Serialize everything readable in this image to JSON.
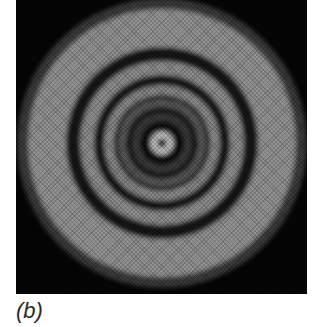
{
  "figure": {
    "panel_label": "(b)",
    "center": {
      "x": 146,
      "y": 143
    },
    "rings": [
      {
        "r_inner": 0,
        "r_outer": 4,
        "shade": "#050505"
      },
      {
        "r_inner": 4,
        "r_outer": 12,
        "shade": "#bdbdbd"
      },
      {
        "r_inner": 12,
        "r_outer": 22,
        "shade": "#0a0a0a"
      },
      {
        "r_inner": 22,
        "r_outer": 30,
        "shade": "#3a3a3a"
      },
      {
        "r_inner": 30,
        "r_outer": 36,
        "shade": "#151515"
      },
      {
        "r_inner": 36,
        "r_outer": 44,
        "shade": "#5a5a5a"
      },
      {
        "r_inner": 44,
        "r_outer": 48,
        "shade": "#1a1a1a"
      },
      {
        "r_inner": 48,
        "r_outer": 58,
        "shade": "#8a8a8a"
      },
      {
        "r_inner": 58,
        "r_outer": 68,
        "shade": "#151515"
      },
      {
        "r_inner": 68,
        "r_outer": 82,
        "shade": "#8e8e8e"
      },
      {
        "r_inner": 82,
        "r_outer": 96,
        "shade": "#121212"
      },
      {
        "r_inner": 96,
        "r_outer": 134,
        "shade": "#939393"
      },
      {
        "r_inner": 134,
        "r_outer": 145,
        "shade": "#3a3a3a"
      }
    ]
  }
}
